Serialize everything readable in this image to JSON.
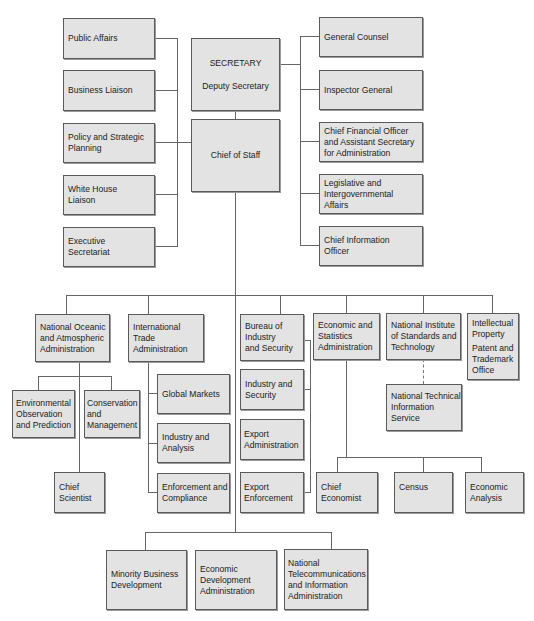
{
  "diagram": {
    "type": "org-chart",
    "colors": {
      "box_fill": "#e3e3e3",
      "box_border": "#5a5a5a",
      "connector": "#666666"
    },
    "top": {
      "secretary": {
        "title": "SECRETARY",
        "subtitle": "Deputy Secretary"
      },
      "chief_of_staff": "Chief of Staff"
    },
    "staff_left": [
      {
        "lines": [
          "Public Affairs"
        ]
      },
      {
        "lines": [
          "Business Liaison"
        ]
      },
      {
        "lines": [
          "Policy and Strategic",
          "Planning"
        ]
      },
      {
        "lines": [
          "White House",
          "Liaison"
        ]
      },
      {
        "lines": [
          "Executive",
          "Secretariat"
        ]
      }
    ],
    "staff_right": [
      {
        "lines": [
          "General Counsel"
        ]
      },
      {
        "lines": [
          "Inspector General"
        ]
      },
      {
        "lines": [
          "Chief Financial Officer",
          "and Assistant Secretary",
          "for Administration"
        ]
      },
      {
        "lines": [
          "Legislative and",
          "Intergovernmental",
          "Affairs"
        ]
      },
      {
        "lines": [
          "Chief Information",
          "Officer"
        ]
      }
    ],
    "bureaus": {
      "noaa": {
        "lines": [
          "National Oceanic",
          "and Atmospheric",
          "Administration"
        ],
        "children": [
          {
            "lines": [
              "Environmental",
              "Observation",
              "and Prediction"
            ]
          },
          {
            "lines": [
              "Conservation",
              "and",
              "Management"
            ]
          },
          {
            "lines": [
              "Chief",
              "Scientist"
            ]
          }
        ]
      },
      "ita": {
        "lines": [
          "International",
          "Trade",
          "Administration"
        ],
        "children": [
          {
            "lines": [
              "Global Markets"
            ]
          },
          {
            "lines": [
              "Industry and",
              "Analysis"
            ]
          },
          {
            "lines": [
              "Enforcement and",
              "Compliance"
            ]
          }
        ]
      },
      "bis": {
        "lines": [
          "Bureau of",
          "Industry",
          "and Security"
        ],
        "children": [
          {
            "lines": [
              "Industry and",
              "Security"
            ]
          },
          {
            "lines": [
              "Export",
              "Administration"
            ]
          },
          {
            "lines": [
              "Export",
              "Enforcement"
            ]
          }
        ]
      },
      "esa": {
        "lines": [
          "Economic and",
          "Statistics",
          "Administration"
        ],
        "children": [
          {
            "lines": [
              "Chief",
              "Economist"
            ]
          },
          {
            "lines": [
              "Census"
            ]
          },
          {
            "lines": [
              "Economic",
              "Analysis"
            ]
          }
        ]
      },
      "nist": {
        "lines": [
          "National Institute",
          "of Standards and",
          "Technology"
        ],
        "children": [
          {
            "lines": [
              "National Technical",
              "Information",
              "Service"
            ]
          }
        ]
      },
      "uspto": {
        "title_lines": [
          "Intellectual",
          "Property"
        ],
        "sub_lines": [
          "Patent and",
          "Trademark",
          "Office"
        ]
      }
    },
    "bottom": [
      {
        "lines": [
          "Minority Business",
          "Development"
        ]
      },
      {
        "lines": [
          "Economic",
          "Development",
          "Administration"
        ]
      },
      {
        "lines": [
          "National",
          "Telecommunications",
          "and Information",
          "Administration"
        ]
      }
    ]
  }
}
